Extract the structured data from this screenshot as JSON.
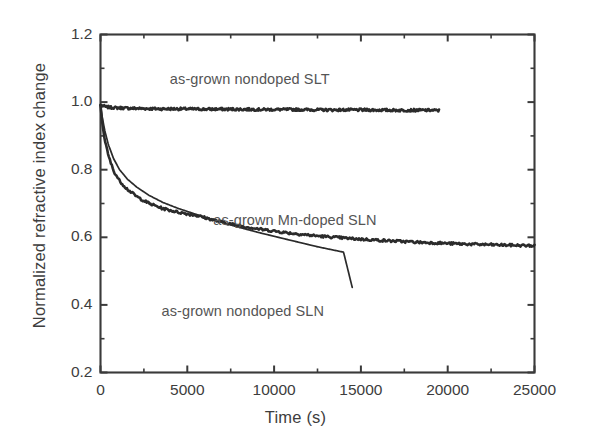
{
  "chart_data": {
    "type": "line",
    "title": "",
    "subtitle": "",
    "xlabel": "Time (s)",
    "ylabel": "Normalized refractive index change",
    "xlim": [
      0,
      25000
    ],
    "ylim": [
      0.2,
      1.2
    ],
    "xticks": [
      0,
      5000,
      10000,
      15000,
      20000,
      25000
    ],
    "xtick_labels": [
      "0",
      "5000",
      "10000",
      "15000",
      "20000",
      "25000"
    ],
    "xminor_step": 2500,
    "yticks": [
      0.2,
      0.4,
      0.6,
      0.8,
      1.0,
      1.2
    ],
    "ytick_labels": [
      "0.2",
      "0.4",
      "0.6",
      "0.8",
      "1.0",
      "1.2"
    ],
    "yminor_step": 0.1,
    "grid": false,
    "legend_position": "inline-annotations",
    "series": [
      {
        "name": "as-grown nondoped SLT",
        "color": "#2b2b2b",
        "noisy": true,
        "x": [
          0,
          120,
          300,
          600,
          1000,
          1600,
          2400,
          3400,
          4600,
          6000,
          7600,
          9400,
          11200,
          13000,
          15000,
          17000,
          19000,
          19500
        ],
        "y": [
          0.992,
          0.989,
          0.986,
          0.984,
          0.983,
          0.982,
          0.981,
          0.98,
          0.98,
          0.979,
          0.979,
          0.978,
          0.978,
          0.977,
          0.977,
          0.976,
          0.976,
          0.975
        ]
      },
      {
        "name": "as-grown Mn-doped SLN",
        "color": "#2b2b2b",
        "noisy": true,
        "x": [
          0,
          100,
          250,
          450,
          750,
          1100,
          1550,
          2100,
          2800,
          3600,
          4500,
          5500,
          6600,
          7800,
          9200,
          10800,
          12500,
          14500,
          16500,
          18500,
          20500,
          22500,
          25000
        ],
        "y": [
          0.99,
          0.94,
          0.888,
          0.842,
          0.797,
          0.767,
          0.742,
          0.72,
          0.7,
          0.685,
          0.674,
          0.665,
          0.65,
          0.636,
          0.624,
          0.613,
          0.604,
          0.596,
          0.59,
          0.585,
          0.581,
          0.578,
          0.575
        ]
      },
      {
        "name": "as-grown nondoped SLN",
        "color": "#2b2b2b",
        "noisy": false,
        "x": [
          0,
          100,
          250,
          450,
          750,
          1100,
          1550,
          2100,
          2800,
          3600,
          4500,
          5500,
          6600,
          7800,
          9200,
          10800,
          12500,
          14000,
          14500
        ],
        "y": [
          0.99,
          0.955,
          0.915,
          0.875,
          0.833,
          0.8,
          0.772,
          0.748,
          0.724,
          0.703,
          0.685,
          0.668,
          0.65,
          0.632,
          0.613,
          0.593,
          0.572,
          0.556,
          0.452
        ]
      }
    ],
    "annotations": [
      {
        "id": "anno-slt",
        "text": "as-grown nondoped SLT",
        "x": 8600,
        "y": 1.065
      },
      {
        "id": "anno-mn-sln",
        "text": "as-grown Mn-doped SLN",
        "x": 11200,
        "y": 0.648
      },
      {
        "id": "anno-sln",
        "text": "as-grown nondoped SLN",
        "x": 8200,
        "y": 0.378
      }
    ]
  },
  "axis": {
    "x_label": "Time (s)",
    "y_label": "Normalized refractive index change"
  },
  "colors": {
    "line": "#2b2b2b",
    "frame": "#3a3a3a",
    "text": "#3d3d3d",
    "annotation": "#555555",
    "background": "#ffffff"
  }
}
